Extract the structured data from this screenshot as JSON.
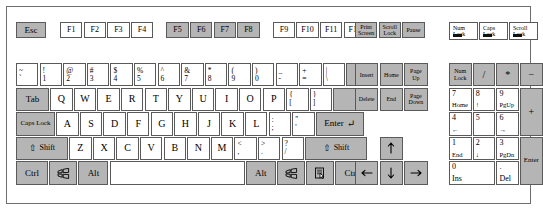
{
  "diagram": {
    "colors": {
      "key_gray": "#b5b5b5",
      "key_white": "#ffffff",
      "border": "#5a5a5a",
      "led": "#111111"
    }
  },
  "function_row": {
    "esc": "Esc",
    "group1": [
      "F1",
      "F2",
      "F3",
      "F4"
    ],
    "group2": [
      "F5",
      "F6",
      "F7",
      "F8"
    ],
    "group3": [
      "F9",
      "F10",
      "F11",
      "F12"
    ],
    "control_keys": [
      {
        "top": "Print",
        "bottom": "Screen"
      },
      {
        "top": "Scroll",
        "bottom": "Lock"
      },
      {
        "top": "Pause",
        "bottom": ""
      }
    ],
    "indicators": [
      {
        "top": "Num",
        "bottom": "Lock"
      },
      {
        "top": "Caps",
        "bottom": "Lock"
      },
      {
        "top": "Scroll",
        "bottom": "Lock"
      }
    ]
  },
  "number_row": {
    "keys": [
      {
        "upper": "~",
        "lower": "`"
      },
      {
        "upper": "!",
        "lower": "1"
      },
      {
        "upper": "@",
        "lower": "2"
      },
      {
        "upper": "#",
        "lower": "3"
      },
      {
        "upper": "$",
        "lower": "4"
      },
      {
        "upper": "%",
        "lower": "5"
      },
      {
        "upper": "^",
        "lower": "6"
      },
      {
        "upper": "&",
        "lower": "7"
      },
      {
        "upper": "*",
        "lower": "8"
      },
      {
        "upper": "(",
        "lower": "9"
      },
      {
        "upper": ")",
        "lower": "0"
      },
      {
        "upper": "_",
        "lower": "-"
      },
      {
        "upper": "+",
        "lower": "="
      },
      {
        "upper": "|",
        "lower": "\\"
      }
    ],
    "backspace": "←"
  },
  "qwerty_row": {
    "tab": "Tab",
    "letters": [
      "Q",
      "W",
      "E",
      "R",
      "T",
      "Y",
      "U",
      "I",
      "O",
      "P"
    ],
    "brackets": [
      {
        "upper": "{",
        "lower": "["
      },
      {
        "upper": "}",
        "lower": "]"
      }
    ]
  },
  "home_row": {
    "caps_lock": "Caps Lock",
    "letters": [
      "A",
      "S",
      "D",
      "F",
      "G",
      "H",
      "J",
      "K",
      "L"
    ],
    "punct": [
      {
        "upper": ":",
        "lower": ";"
      },
      {
        "upper": "\"",
        "lower": "'"
      }
    ],
    "enter": "Enter",
    "enter_glyph": "↵"
  },
  "shift_row": {
    "shift_left": "Shift",
    "shift_right": "Shift",
    "shift_glyph": "⇧",
    "letters": [
      "Z",
      "X",
      "C",
      "V",
      "B",
      "N",
      "M"
    ],
    "punct": [
      {
        "upper": "<",
        "lower": ","
      },
      {
        "upper": ">",
        "lower": "."
      },
      {
        "upper": "?",
        "lower": "/"
      }
    ]
  },
  "bottom_row": {
    "ctrl_left": "Ctrl",
    "alt_left": "Alt",
    "space": "",
    "alt_right": "Alt",
    "ctrl_right": "Ctrl",
    "win_left": "windows-logo",
    "win_right": "windows-logo",
    "menu": "context-menu"
  },
  "nav_cluster": {
    "row1": [
      {
        "top": "Insert",
        "bottom": ""
      },
      {
        "top": "Home",
        "bottom": ""
      },
      {
        "top": "Page",
        "bottom": "Up"
      }
    ],
    "row2": [
      {
        "top": "Delete",
        "bottom": ""
      },
      {
        "top": "End",
        "bottom": ""
      },
      {
        "top": "Page",
        "bottom": "Down"
      }
    ]
  },
  "arrows": {
    "up": "↑",
    "down": "↓",
    "left": "←",
    "right": "→"
  },
  "numpad": {
    "row1": [
      {
        "top": "Num",
        "bottom": "Lock",
        "two_line": true
      },
      {
        "top": "/",
        "bottom": ""
      },
      {
        "top": "*",
        "bottom": ""
      },
      {
        "top": "−",
        "bottom": ""
      }
    ],
    "row2": [
      {
        "top": "7",
        "bottom": "Home"
      },
      {
        "top": "8",
        "bottom": "↑"
      },
      {
        "top": "9",
        "bottom": "PgUp"
      }
    ],
    "row3": [
      {
        "top": "4",
        "bottom": "←"
      },
      {
        "top": "5",
        "bottom": ""
      },
      {
        "top": "6",
        "bottom": "→"
      }
    ],
    "row4": [
      {
        "top": "1",
        "bottom": "End"
      },
      {
        "top": "2",
        "bottom": "↓"
      },
      {
        "top": "3",
        "bottom": "PgDn"
      }
    ],
    "row5": [
      {
        "top": "0",
        "bottom": "Ins"
      },
      {
        "top": ".",
        "bottom": "Del"
      }
    ],
    "plus": "+",
    "enter": "Enter"
  }
}
